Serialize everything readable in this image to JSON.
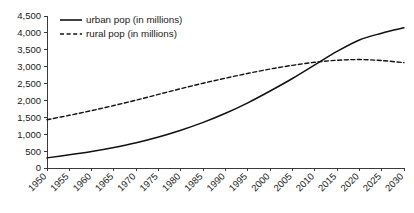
{
  "chart_data": {
    "type": "line",
    "title": "",
    "subtitle": "",
    "xlabel": "",
    "ylabel": "",
    "grid": false,
    "legend_position": "top-left",
    "x": [
      1950,
      1955,
      1960,
      1965,
      1970,
      1975,
      1980,
      1985,
      1990,
      1995,
      2000,
      2005,
      2010,
      2015,
      2020,
      2025,
      2030
    ],
    "categories": [
      "1950",
      "1955",
      "1960",
      "1965",
      "1970",
      "1975",
      "1980",
      "1985",
      "1990",
      "1995",
      "2000",
      "2005",
      "2010",
      "2015",
      "2020",
      "2025",
      "2030"
    ],
    "xlim": [
      1950,
      2030
    ],
    "ylim": [
      0,
      4500
    ],
    "y_ticks": [
      0,
      500,
      1000,
      1500,
      2000,
      2500,
      3000,
      3500,
      4000,
      4500
    ],
    "y_tick_labels": [
      "0",
      "500",
      "1,000",
      "1,500",
      "2,000",
      "2,500",
      "3,000",
      "3,500",
      "4,000",
      "4,500"
    ],
    "series": [
      {
        "name": "urban pop (in millions)",
        "style": "solid",
        "color": "#111111",
        "values": [
          300,
          390,
          490,
          610,
          750,
          920,
          1120,
          1350,
          1620,
          1930,
          2280,
          2650,
          3050,
          3450,
          3790,
          3990,
          4150
        ]
      },
      {
        "name": "rural pop  (in millions)",
        "style": "dashed",
        "color": "#111111",
        "values": [
          1430,
          1560,
          1700,
          1850,
          2010,
          2180,
          2350,
          2510,
          2660,
          2800,
          2930,
          3040,
          3130,
          3190,
          3210,
          3180,
          3120
        ]
      }
    ]
  },
  "legend": {
    "items": [
      {
        "label": "urban pop (in millions)",
        "style": "solid"
      },
      {
        "label": "rural pop  (in millions)",
        "style": "dashed"
      }
    ]
  },
  "axes": {
    "y_axis_name": "population-axis",
    "x_axis_name": "year-axis"
  }
}
